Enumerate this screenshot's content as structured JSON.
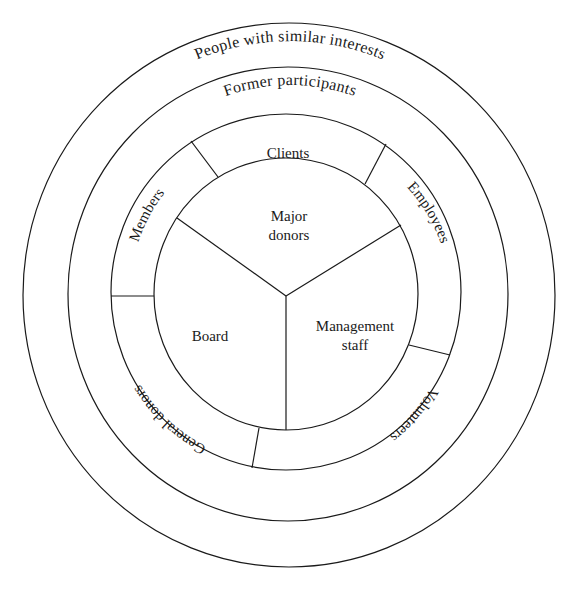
{
  "diagram": {
    "type": "concentric-stakeholder-circles",
    "rings": {
      "outermost": {
        "label": "People with similar interests"
      },
      "second": {
        "label": "Former participants"
      },
      "third": {
        "segments": [
          {
            "label": "Clients"
          },
          {
            "label": "Employees"
          },
          {
            "label": "Volunteers"
          },
          {
            "label": "General donors"
          },
          {
            "label": "Members"
          }
        ]
      },
      "core": {
        "segments": [
          {
            "label_line1": "Major",
            "label_line2": "donors"
          },
          {
            "label_line1": "Management",
            "label_line2": "staff"
          },
          {
            "label_line1": "Board"
          }
        ]
      }
    },
    "colors": {
      "stroke": "#1a1a1a",
      "background": "#ffffff"
    }
  }
}
